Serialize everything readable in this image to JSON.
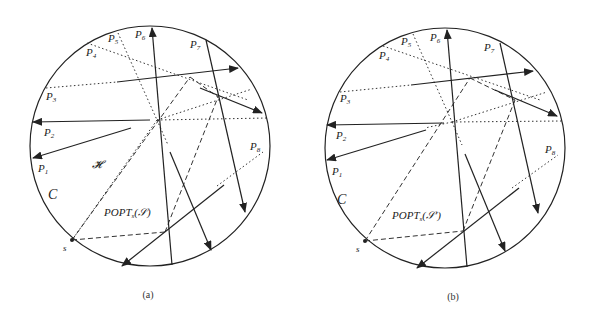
{
  "figure": {
    "panels": [
      {
        "id": "a",
        "caption": "(a)",
        "circle_label": "C",
        "region_label": "𝓗",
        "set_label": "POPT",
        "set_sub": "s",
        "set_arg": "(𝒮)",
        "point_label": "s",
        "path_labels": [
          "P",
          "P",
          "P",
          "P",
          "P",
          "P",
          "P",
          "P"
        ],
        "path_subs": [
          "1",
          "2",
          "3",
          "4",
          "5",
          "6",
          "7",
          "8"
        ]
      },
      {
        "id": "b",
        "caption": "(b)",
        "circle_label": "C",
        "set_label": "POPT",
        "set_sub": "s",
        "set_arg": "(𝒮′)",
        "point_label": "s",
        "path_labels": [
          "P",
          "P",
          "P",
          "P",
          "P",
          "P",
          "P",
          "P"
        ],
        "path_subs": [
          "1",
          "2",
          "3",
          "4",
          "5",
          "6",
          "7",
          "8"
        ]
      }
    ],
    "colors": {
      "stroke": "#222222",
      "background": "#ffffff"
    }
  }
}
